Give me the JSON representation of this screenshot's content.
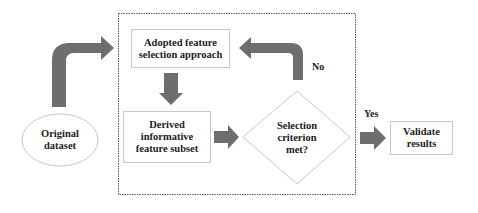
{
  "diagram": {
    "type": "flowchart",
    "colors": {
      "arrow_fill": "#6e6e6e",
      "node_border": "#c8c8c8",
      "container_border": "#555555",
      "text": "#222222",
      "background": "#ffffff"
    },
    "nodes": {
      "original_dataset": {
        "shape": "ellipse",
        "line1": "Original",
        "line2": "dataset"
      },
      "adopted_approach": {
        "shape": "rectangle",
        "line1": "Adopted feature",
        "line2": "selection approach"
      },
      "derived_subset": {
        "shape": "rectangle",
        "line1": "Derived",
        "line2": "informative",
        "line3": "feature subset"
      },
      "selection_criterion": {
        "shape": "diamond",
        "line1": "Selection",
        "line2": "criterion",
        "line3": "met?"
      },
      "validate_results": {
        "shape": "rectangle",
        "line1": "Validate",
        "line2": "results"
      }
    },
    "edges": [
      {
        "from": "original_dataset",
        "to": "adopted_approach",
        "label": ""
      },
      {
        "from": "adopted_approach",
        "to": "derived_subset",
        "label": ""
      },
      {
        "from": "derived_subset",
        "to": "selection_criterion",
        "label": ""
      },
      {
        "from": "selection_criterion",
        "to": "adopted_approach",
        "label": "No"
      },
      {
        "from": "selection_criterion",
        "to": "validate_results",
        "label": "Yes"
      }
    ],
    "labels": {
      "no": "No",
      "yes": "Yes"
    },
    "container": {
      "style": "dotted",
      "encloses": [
        "adopted_approach",
        "derived_subset",
        "selection_criterion"
      ]
    }
  }
}
